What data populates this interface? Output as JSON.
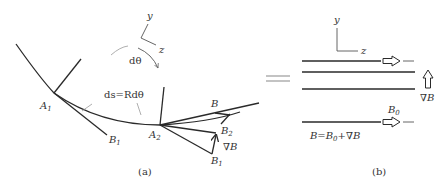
{
  "figure": {
    "panel_a": {
      "caption": "(a)",
      "axes": {
        "y_label": "y",
        "z_label": "z"
      },
      "angle_label": "dθ",
      "arc_length_label": "ds=Rdθ",
      "points": {
        "A1": {
          "base": "A",
          "sub": "1"
        },
        "A2": {
          "base": "A",
          "sub": "2"
        },
        "B1_left": {
          "base": "B",
          "sub": "1"
        },
        "B2": {
          "base": "B",
          "sub": "2"
        },
        "B1_right": {
          "base": "B",
          "sub": "1"
        },
        "B": {
          "base": "B",
          "sub": ""
        }
      },
      "gradient_label": "∇B"
    },
    "equals_sign": "=",
    "panel_b": {
      "caption": "(b)",
      "axes": {
        "y_label": "y",
        "z_label": "z"
      },
      "gradient_label": "∇B",
      "B0_label": {
        "base": "B",
        "sub": "0"
      },
      "equation": {
        "lhs": "B",
        "eq": "=",
        "b0_base": "B",
        "b0_sub": "0",
        "plus": "+",
        "grad": "∇B"
      }
    }
  }
}
